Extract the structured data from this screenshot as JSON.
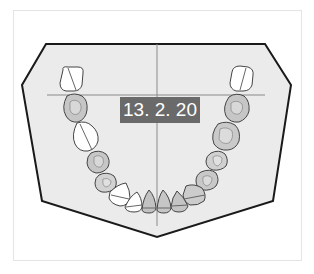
{
  "diagram": {
    "date_label": "13. 2. 20",
    "colors": {
      "arch_fill": "#ebebeb",
      "arch_outline": "#1a1a1a",
      "guide_line": "#8a8a8a",
      "tooth_white": "#ffffff",
      "tooth_shaded": "#c9c9c9",
      "tooth_outline": "#444444",
      "label_bg": "#6a6a6a",
      "label_text": "#ffffff"
    },
    "teeth": {
      "left": [
        {
          "id": "L-molar-3",
          "state": "white"
        },
        {
          "id": "L-molar-2",
          "state": "shaded"
        },
        {
          "id": "L-molar-1",
          "state": "white"
        },
        {
          "id": "L-premolar-2",
          "state": "shaded"
        },
        {
          "id": "L-premolar-1",
          "state": "shaded"
        },
        {
          "id": "L-canine",
          "state": "white"
        },
        {
          "id": "L-incisor-lateral",
          "state": "white"
        },
        {
          "id": "L-incisor-central",
          "state": "shaded"
        }
      ],
      "right": [
        {
          "id": "R-molar-3",
          "state": "white"
        },
        {
          "id": "R-molar-2",
          "state": "shaded"
        },
        {
          "id": "R-molar-1",
          "state": "shaded"
        },
        {
          "id": "R-premolar-2",
          "state": "shaded"
        },
        {
          "id": "R-premolar-1",
          "state": "shaded"
        },
        {
          "id": "R-canine",
          "state": "shaded"
        },
        {
          "id": "R-incisor-lateral",
          "state": "shaded"
        },
        {
          "id": "R-incisor-central",
          "state": "shaded"
        }
      ]
    }
  }
}
